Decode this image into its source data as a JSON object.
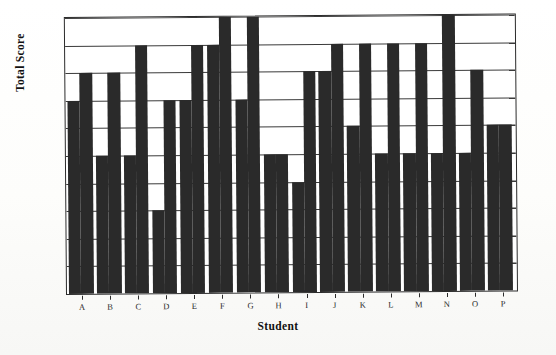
{
  "chart_data": {
    "type": "bar",
    "title": "",
    "xlabel": "Student",
    "ylabel": "Total Score",
    "ylim": [
      0,
      10
    ],
    "yticks": [
      0,
      1,
      2,
      3,
      4,
      5,
      6,
      7,
      8,
      9,
      10
    ],
    "grid": true,
    "legend": "none",
    "categories": [
      "A",
      "B",
      "C",
      "D",
      "E",
      "F",
      "G",
      "H",
      "I",
      "J",
      "K",
      "L",
      "M",
      "N",
      "O",
      "P"
    ],
    "series": [
      {
        "name": "bar-1",
        "values": [
          7,
          5,
          5,
          3,
          7,
          9,
          7,
          5,
          4,
          8,
          6,
          5,
          5,
          5,
          5,
          6
        ]
      },
      {
        "name": "bar-2",
        "values": [
          8,
          8,
          9,
          7,
          9,
          10,
          10,
          5,
          8,
          9,
          9,
          9,
          9,
          10,
          8,
          6
        ]
      }
    ],
    "bar_color": "#2a2a2a",
    "axis_color": "#2b2b2b",
    "plot_background": "#ffffff"
  }
}
